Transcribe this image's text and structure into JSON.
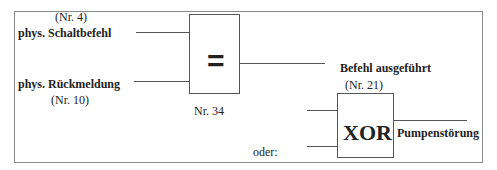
{
  "diagram": {
    "inputs": {
      "schaltbefehl": {
        "number": "(Nr. 4)",
        "label": "phys. Schaltbefehl"
      },
      "rueckmeldung": {
        "label": "phys. Rückmeldung",
        "number": "(Nr. 10)"
      }
    },
    "equality_gate": {
      "symbol": "=",
      "number": "Nr. 34"
    },
    "output": {
      "label": "Befehl ausgeführt",
      "number": "(Nr. 21)"
    },
    "xor_gate": {
      "symbol": "XOR",
      "prefix": "oder:",
      "output_label": "Pumpenstörung"
    }
  }
}
